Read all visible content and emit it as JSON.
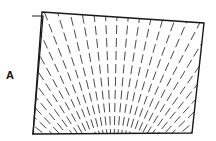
{
  "figure": {
    "panel_label": "A",
    "colors": {
      "stroke": "#1a1a1a",
      "background": "#ffffff"
    },
    "front_sheet": [
      [
        42,
        12
      ],
      [
        204,
        23
      ],
      [
        192,
        133
      ],
      [
        33,
        134
      ]
    ],
    "back_sheet": [
      [
        32,
        16
      ],
      [
        43,
        16
      ],
      [
        33,
        134
      ],
      [
        32,
        134
      ]
    ],
    "focus": [
      113,
      190
    ],
    "ray_count": 34
  }
}
